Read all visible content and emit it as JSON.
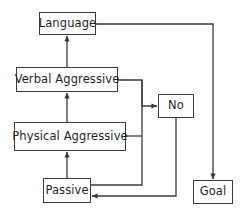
{
  "diagram": {
    "stroke_color": "#3b3b3b",
    "background_color": "#ffffff",
    "text_color": "#1f1f1f",
    "nodes": [
      {
        "id": "language",
        "label": "Language",
        "x": 39,
        "y": 12,
        "w": 57,
        "h": 23
      },
      {
        "id": "verbal_aggressive",
        "label": "Verbal Aggressive",
        "x": 16,
        "y": 67,
        "w": 102,
        "h": 25
      },
      {
        "id": "physical_aggressive",
        "label": "Physical Aggressive",
        "x": 14,
        "y": 122,
        "w": 112,
        "h": 29
      },
      {
        "id": "passive",
        "label": "Passive",
        "x": 43,
        "y": 178,
        "w": 48,
        "h": 25
      },
      {
        "id": "no",
        "label": "No",
        "x": 158,
        "y": 94,
        "w": 36,
        "h": 24
      },
      {
        "id": "goal",
        "label": "Goal",
        "x": 193,
        "y": 180,
        "w": 40,
        "h": 24
      }
    ],
    "edges": [
      {
        "id": "passive-to-physical",
        "from": "passive",
        "to": "physical_aggressive",
        "arrow": true,
        "path": "M 67 178 L 67 152"
      },
      {
        "id": "physical-to-verbal",
        "from": "physical_aggressive",
        "to": "verbal_aggressive",
        "arrow": true,
        "path": "M 67 122 L 67 93"
      },
      {
        "id": "verbal-to-language",
        "from": "verbal_aggressive",
        "to": "language",
        "arrow": true,
        "path": "M 67 67 L 67 36"
      },
      {
        "id": "language-to-goal",
        "from": "language",
        "to": "goal",
        "arrow": true,
        "path": "M 96 24 L 213 24 L 213 179"
      },
      {
        "id": "verbal-to-no",
        "from": "verbal_aggressive",
        "to": "no",
        "arrow": true,
        "path": "M 118 80 L 142 80 L 142 106 L 157 106"
      },
      {
        "id": "physical-to-junction",
        "from": "physical_aggressive",
        "to": "no",
        "arrow": false,
        "path": "M 126 136 L 142 136"
      },
      {
        "id": "passive-to-junction",
        "from": "passive",
        "to": "no",
        "arrow": false,
        "path": "M 91 185 L 142 185 L 142 80"
      },
      {
        "id": "no-to-passive",
        "from": "no",
        "to": "passive",
        "arrow": true,
        "path": "M 176 118 L 176 196 L 92 196"
      }
    ]
  }
}
